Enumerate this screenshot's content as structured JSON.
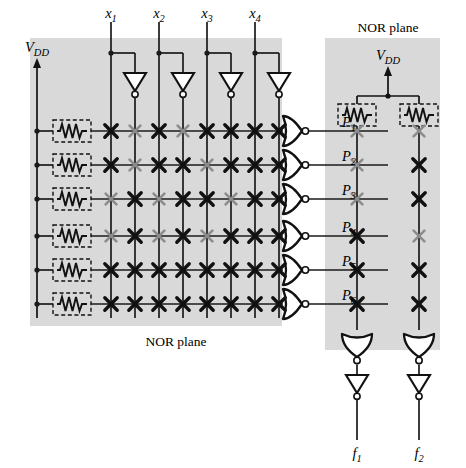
{
  "figure": {
    "type": "pla-circuit-diagram",
    "title_visible": false,
    "plane_labels": {
      "and_plane": "NOR plane",
      "nor_plane": "NOR plane"
    },
    "power_labels": {
      "left": "VDD",
      "right": "VDD"
    },
    "colors": {
      "plane_fill": "#d9d9d9",
      "wire": "#1a1a1a",
      "connected_cross": "#111111",
      "unconnected_cross": "#8c8c8c",
      "background": "#ffffff"
    }
  },
  "inputs": [
    {
      "id": "x1",
      "base": "x",
      "sub": "1"
    },
    {
      "id": "x2",
      "base": "x",
      "sub": "2"
    },
    {
      "id": "x3",
      "base": "x",
      "sub": "3"
    },
    {
      "id": "x4",
      "base": "x",
      "sub": "4"
    }
  ],
  "product_terms": [
    {
      "id": "P1",
      "base": "P",
      "sub": "1"
    },
    {
      "id": "P2",
      "base": "P",
      "sub": "2"
    },
    {
      "id": "P3",
      "base": "P",
      "sub": "3"
    },
    {
      "id": "P4",
      "base": "P",
      "sub": "4"
    },
    {
      "id": "P5",
      "base": "P",
      "sub": "5"
    },
    {
      "id": "P6",
      "base": "P",
      "sub": "6"
    }
  ],
  "outputs": [
    {
      "id": "f1",
      "base": "f",
      "sub": "1"
    },
    {
      "id": "f2",
      "base": "f",
      "sub": "2"
    }
  ],
  "and_plane_columns": [
    "x1",
    "x1bar",
    "x2",
    "x2bar",
    "x3",
    "x3bar",
    "x4",
    "x4bar"
  ],
  "and_plane_matrix": [
    [
      "on",
      "off",
      "on",
      "off",
      "on",
      "on",
      "on",
      "on"
    ],
    [
      "on",
      "off",
      "on",
      "on",
      "off",
      "on",
      "on",
      "on"
    ],
    [
      "off",
      "on",
      "off",
      "on",
      "on",
      "off",
      "on",
      "on"
    ],
    [
      "off",
      "on",
      "off",
      "on",
      "off",
      "on",
      "on",
      "on"
    ],
    [
      "on",
      "on",
      "on",
      "on",
      "on",
      "on",
      "on",
      "on"
    ],
    [
      "on",
      "on",
      "on",
      "on",
      "on",
      "on",
      "on",
      "on"
    ]
  ],
  "nor_plane_columns": [
    "f1",
    "f2"
  ],
  "nor_plane_matrix": [
    [
      "off",
      "off"
    ],
    [
      "off",
      "on"
    ],
    [
      "off",
      "on"
    ],
    [
      "on",
      "off"
    ],
    [
      "on",
      "on"
    ],
    [
      "on",
      "on"
    ]
  ],
  "components": {
    "input_inverters": 4,
    "pullup_resistors_left": 6,
    "pullup_resistors_right": 2,
    "product_nor_gates": 6,
    "output_nor_gates": 2,
    "output_inverters": 2
  },
  "icon_names": {
    "resistor": "resistor-icon",
    "inverter": "inverter-gate-icon",
    "nor_gate": "nor-gate-icon",
    "cross_connected": "connected-crosspoint-icon",
    "cross_open": "open-crosspoint-icon",
    "vdd_arrow": "vdd-supply-arrow-icon"
  }
}
